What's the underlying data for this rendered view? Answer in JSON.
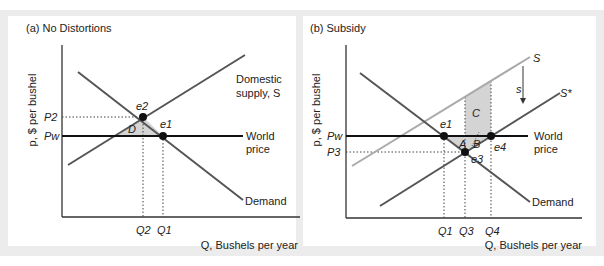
{
  "panels": [
    {
      "id": "a",
      "title": "(a) No Distortions",
      "y_axis_label": "p, $ per bushel",
      "x_axis_label": "Q, Bushels per year",
      "curves": {
        "supply_label_line1": "Domestic",
        "supply_label_line2": "supply, S",
        "demand_label": "Demand",
        "world_label_line1": "World",
        "world_label_line2": "price"
      },
      "price_labels": {
        "p2": "P2",
        "pw": "Pw"
      },
      "quantity_labels": {
        "q2": "Q2",
        "q1": "Q1"
      },
      "points": {
        "e2": "e2",
        "e1": "e1"
      },
      "areas": {
        "d": "D"
      }
    },
    {
      "id": "b",
      "title": "(b) Subsidy",
      "y_axis_label": "p, $ per bushel",
      "x_axis_label": "Q, Bushels per year",
      "curves": {
        "supply_label": "S",
        "subsidized_supply_label": "S*",
        "subsidy_label": "s",
        "demand_label": "Demand",
        "world_label_line1": "World",
        "world_label_line2": "price"
      },
      "price_labels": {
        "pw": "Pw",
        "p3": "P3"
      },
      "quantity_labels": {
        "q1": "Q1",
        "q3": "Q3",
        "q4": "Q4"
      },
      "points": {
        "e1": "e1",
        "e3": "e3",
        "e4": "e4"
      },
      "areas": {
        "a": "A",
        "b": "B",
        "c": "C"
      }
    }
  ],
  "colors": {
    "frame_bg": "#ececec",
    "curve_dark": "#555555",
    "curve_light": "#aaaaaa",
    "world_line": "#111111",
    "shade": "#d4d4d4"
  }
}
